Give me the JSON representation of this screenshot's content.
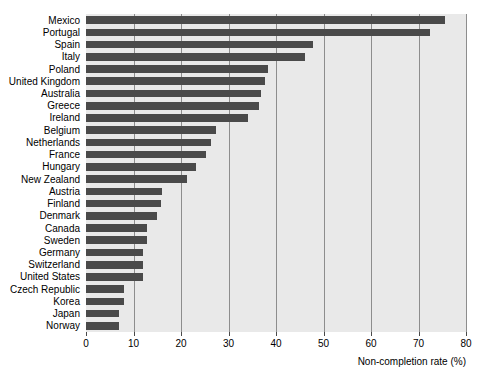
{
  "chart_data": {
    "type": "bar",
    "orientation": "horizontal",
    "title": "",
    "subtitle": "",
    "xlabel": "Non-completion rate (%)",
    "ylabel": "",
    "xlim": [
      0,
      80
    ],
    "ylim": null,
    "grid": true,
    "legend": null,
    "legend_position": "none",
    "xticks": [
      0,
      10,
      20,
      30,
      40,
      50,
      60,
      70,
      80
    ],
    "xtick_labels": [
      "0",
      "10",
      "20",
      "30",
      "40",
      "50",
      "60",
      "70",
      "80"
    ],
    "categories": [
      "Mexico",
      "Portugal",
      "Spain",
      "Italy",
      "Poland",
      "United Kingdom",
      "Australia",
      "Greece",
      "Ireland",
      "Belgium",
      "Netherlands",
      "France",
      "Hungary",
      "New Zealand",
      "Austria",
      "Finland",
      "Denmark",
      "Canada",
      "Sweden",
      "Germany",
      "Switzerland",
      "United States",
      "Czech Republic",
      "Korea",
      "Japan",
      "Norway"
    ],
    "values": [
      75.5,
      72.5,
      47.8,
      46.0,
      38.3,
      37.7,
      36.8,
      36.4,
      34.1,
      27.4,
      26.3,
      25.3,
      23.2,
      21.3,
      16.0,
      15.8,
      15.0,
      12.8,
      12.8,
      12.0,
      12.0,
      12.0,
      8.0,
      8.0,
      7.0,
      7.0
    ],
    "series": [
      {
        "name": "Non-completion rate",
        "values": [
          75.5,
          72.5,
          47.8,
          46.0,
          38.3,
          37.7,
          36.8,
          36.4,
          34.1,
          27.4,
          26.3,
          25.3,
          23.2,
          21.3,
          16.0,
          15.8,
          15.0,
          12.8,
          12.8,
          12.0,
          12.0,
          12.0,
          8.0,
          8.0,
          7.0,
          7.0
        ]
      }
    ],
    "colors": {
      "bar": "#4a4a4a",
      "plot_background": "#e9e9e9",
      "gridline": "#8d8d8d",
      "text": "#000000",
      "figure_background": "#ffffff"
    }
  }
}
